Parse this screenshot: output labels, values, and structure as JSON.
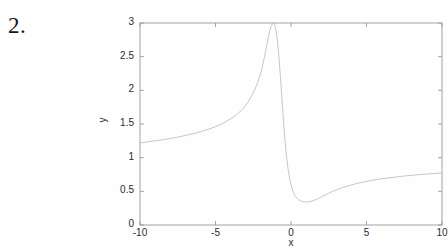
{
  "page": {
    "background_color": "#fefefe",
    "problem_number": "2."
  },
  "figure": {
    "axis_color": "#9a9a9a",
    "curve_color": "#b9b9b9",
    "text_color": "#2b2b2b",
    "plot_box_px": {
      "left": 140,
      "top": 23,
      "right": 442,
      "bottom": 225
    }
  },
  "chart_data": {
    "type": "line",
    "title": "",
    "xlabel": "x",
    "ylabel": "y",
    "xlim": [
      -10,
      10
    ],
    "ylim": [
      0,
      3
    ],
    "xticks": [
      -10,
      -5,
      0,
      5,
      10
    ],
    "xticklabels": [
      "-10",
      "-5",
      "0",
      "5",
      "10"
    ],
    "yticks": [
      0,
      0.5,
      1,
      1.5,
      2,
      2.5,
      3
    ],
    "yticklabels": [
      "0",
      "0.5",
      "1",
      "1.5",
      "2",
      "2.5",
      "3"
    ],
    "grid": false,
    "legend": null,
    "annotations": [],
    "series": [
      {
        "name": "y(x)",
        "color": "#b9b9b9",
        "linewidth": 0.8,
        "peak": {
          "x": -1.15,
          "y": 3.0
        },
        "minimum": {
          "x": 0.9,
          "y": 0.34
        },
        "x": [
          -10.0,
          -9.5,
          -9.0,
          -8.5,
          -8.0,
          -7.5,
          -7.0,
          -6.5,
          -6.0,
          -5.5,
          -5.0,
          -4.5,
          -4.0,
          -3.6,
          -3.2,
          -3.0,
          -2.8,
          -2.6,
          -2.4,
          -2.2,
          -2.0,
          -1.9,
          -1.8,
          -1.7,
          -1.6,
          -1.5,
          -1.4,
          -1.3,
          -1.2,
          -1.15,
          -1.1,
          -1.0,
          -0.9,
          -0.8,
          -0.7,
          -0.6,
          -0.5,
          -0.4,
          -0.3,
          -0.2,
          -0.1,
          0.0,
          0.1,
          0.2,
          0.3,
          0.4,
          0.5,
          0.6,
          0.7,
          0.8,
          0.9,
          1.0,
          1.1,
          1.2,
          1.4,
          1.6,
          1.8,
          2.0,
          2.25,
          2.5,
          2.75,
          3.0,
          3.5,
          4.0,
          4.5,
          5.0,
          5.5,
          6.0,
          6.5,
          7.0,
          7.5,
          8.0,
          8.5,
          9.0,
          9.5,
          10.0
        ],
        "y": [
          1.22,
          1.235,
          1.25,
          1.265,
          1.285,
          1.305,
          1.33,
          1.355,
          1.385,
          1.42,
          1.46,
          1.51,
          1.575,
          1.64,
          1.72,
          1.775,
          1.84,
          1.92,
          2.01,
          2.12,
          2.26,
          2.35,
          2.45,
          2.56,
          2.68,
          2.79,
          2.89,
          2.96,
          2.995,
          3.0,
          2.985,
          2.9,
          2.73,
          2.5,
          2.2,
          1.88,
          1.55,
          1.26,
          1.02,
          0.84,
          0.7,
          0.6,
          0.52,
          0.465,
          0.425,
          0.397,
          0.377,
          0.363,
          0.353,
          0.346,
          0.342,
          0.341,
          0.342,
          0.345,
          0.356,
          0.373,
          0.393,
          0.415,
          0.444,
          0.472,
          0.498,
          0.522,
          0.562,
          0.596,
          0.624,
          0.648,
          0.668,
          0.686,
          0.701,
          0.715,
          0.727,
          0.738,
          0.748,
          0.757,
          0.765,
          0.772
        ]
      }
    ]
  }
}
